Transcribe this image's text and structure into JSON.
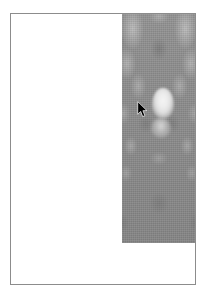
{
  "window": {
    "border_color": "#8c8c8c",
    "background_color": "#ffffff"
  },
  "canvas": {
    "background_color": "#ffffff"
  },
  "image_panel": {
    "name": "grayscale-noise-image",
    "base_color": "#8a8a8a",
    "highlight_color": "#f4f4f4",
    "shadow_color": "#6e6e6e",
    "description": "symmetric mottled grayscale cloud texture"
  },
  "cursor": {
    "type": "arrow-pointer",
    "color": "#000000",
    "outline_color": "#ffffff"
  }
}
